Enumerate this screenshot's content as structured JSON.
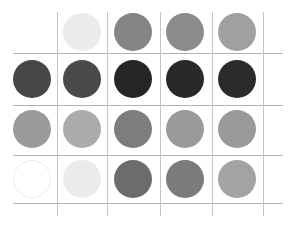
{
  "grid": {
    "line_color": "#b4b4b4",
    "vertical_lines_x": [
      57,
      107,
      160,
      212,
      263
    ],
    "vertical_span": [
      12,
      216
    ],
    "horizontal_lines_y": [
      53,
      105,
      155,
      203
    ],
    "horizontal_span": [
      13,
      283
    ]
  },
  "circles": {
    "radius": 19,
    "column_centers_x": [
      32,
      82,
      133,
      185,
      237
    ],
    "row_centers_y": [
      32,
      79,
      129,
      179
    ],
    "rows": [
      [
        null,
        "#ebebeb",
        "#858585",
        "#8b8b8b",
        "#a0a0a0"
      ],
      [
        "#464646",
        "#4a4a4a",
        "#252525",
        "#292929",
        "#2b2b2b"
      ],
      [
        "#9b9b9b",
        "#ababab",
        "#7d7d7d",
        "#9a9a9a",
        "#9a9a9a"
      ],
      [
        "#ffffff",
        "#ebebeb",
        "#6c6c6c",
        "#7b7b7b",
        "#a3a3a3"
      ]
    ],
    "outline_color": "#ececec"
  }
}
